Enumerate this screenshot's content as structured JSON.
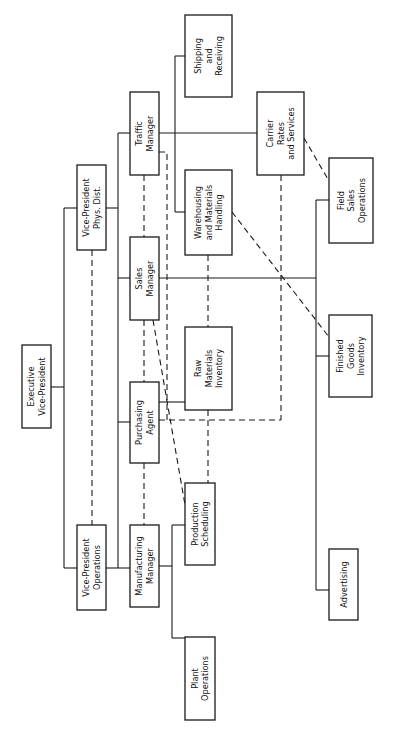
{
  "diagram": {
    "type": "organization-chart",
    "orientation": "rotated 90 degrees counter-clockwise",
    "colors": {
      "line": "#1a1a1a",
      "background": "#ffffff",
      "box_fill": "#ffffff"
    },
    "boxes": [
      {
        "id": "exec_vp",
        "lines": [
          "Executive",
          "Vice-President"
        ],
        "x": 22,
        "y": 345,
        "w": 29,
        "h": 83
      },
      {
        "id": "vp_phys_dist",
        "lines": [
          "Vice-President",
          "Phys. Dist."
        ],
        "x": 77,
        "y": 165,
        "w": 29,
        "h": 85
      },
      {
        "id": "vp_operations",
        "lines": [
          "Vice-President",
          "Operations"
        ],
        "x": 77,
        "y": 525,
        "w": 29,
        "h": 85
      },
      {
        "id": "traffic_manager",
        "lines": [
          "Traffic",
          "Manager"
        ],
        "x": 130,
        "y": 92,
        "w": 29,
        "h": 83
      },
      {
        "id": "sales_manager",
        "lines": [
          "Sales",
          "Manager"
        ],
        "x": 130,
        "y": 237,
        "w": 29,
        "h": 83
      },
      {
        "id": "purchasing_agent",
        "lines": [
          "Purchasing",
          "Agent"
        ],
        "x": 130,
        "y": 382,
        "w": 29,
        "h": 81
      },
      {
        "id": "manufacturing_manager",
        "lines": [
          "Manufacturing",
          "Manager"
        ],
        "x": 130,
        "y": 525,
        "w": 29,
        "h": 82
      },
      {
        "id": "shipping_receiving",
        "lines": [
          "Shipping",
          "and",
          "Receiving"
        ],
        "x": 185,
        "y": 15,
        "w": 47,
        "h": 82
      },
      {
        "id": "warehousing",
        "lines": [
          "Warehousing",
          "and Materials",
          "Handling"
        ],
        "x": 185,
        "y": 170,
        "w": 47,
        "h": 85
      },
      {
        "id": "raw_materials",
        "lines": [
          "Raw",
          "Materials",
          "Inventory"
        ],
        "x": 185,
        "y": 327,
        "w": 47,
        "h": 83
      },
      {
        "id": "production_scheduling",
        "lines": [
          "Production",
          "Scheduling"
        ],
        "x": 185,
        "y": 483,
        "w": 30,
        "h": 82
      },
      {
        "id": "plant_operations",
        "lines": [
          "Plant",
          "Operations"
        ],
        "x": 185,
        "y": 637,
        "w": 30,
        "h": 83
      },
      {
        "id": "carrier_rates",
        "lines": [
          "Carrier",
          "Rates",
          "and Services"
        ],
        "x": 257,
        "y": 92,
        "w": 47,
        "h": 83
      },
      {
        "id": "field_sales",
        "lines": [
          "Field",
          "Sales",
          "Operations"
        ],
        "x": 329,
        "y": 158,
        "w": 44,
        "h": 85
      },
      {
        "id": "finished_goods",
        "lines": [
          "Finished",
          "Goods",
          "Inventory"
        ],
        "x": 329,
        "y": 315,
        "w": 43,
        "h": 82
      },
      {
        "id": "advertising",
        "lines": [
          "Advertising"
        ],
        "x": 329,
        "y": 549,
        "w": 29,
        "h": 71
      }
    ],
    "solid_lines": [
      "M51 387 H64",
      "M64 208 V568",
      "M64 208 H77",
      "M64 568 H77",
      "M106 208 H118",
      "M118 133 V568",
      "M118 133 H130",
      "M118 278 H130",
      "M118 422 H130",
      "M106 568 H130",
      "M159 133 H257",
      "M175 56 V212",
      "M175 56 H185",
      "M175 212 H185",
      "M159 278 H316",
      "M159 402 H185",
      "M159 566 H172",
      "M172 525 V638",
      "M172 525 H185",
      "M172 638 H185",
      "M316 200 V590",
      "M316 200 H329",
      "M316 356 H329",
      "M316 590 H329"
    ],
    "dashed_lines": [
      "M92 250 V525",
      "M144 175 V237",
      "M144 320 V382",
      "M144 463 V525",
      "M159 152 H167 V420",
      "M159 420 H281",
      "M281 175 V420",
      "M208 255 V327",
      "M208 410 V483",
      "M153 320 L185 505",
      "M232 212 L329 337",
      "M304 138 L329 181"
    ]
  }
}
